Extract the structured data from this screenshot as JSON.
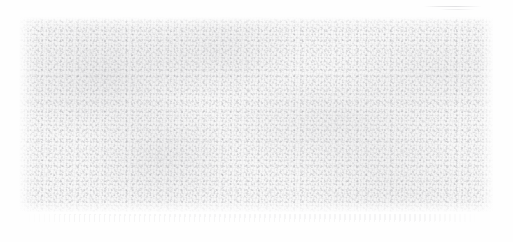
{
  "canvas": {
    "width": 513,
    "height": 242,
    "background_color": "#fefefe"
  },
  "surface": {
    "label": "",
    "kind": "textured-blank-surface",
    "description": "",
    "x": 19,
    "y": 17,
    "width": 474,
    "height": 195,
    "base_color": "#f7f7f7",
    "grain_color": "#8c8c92",
    "edge_color": "#fefefe",
    "visible_text": ""
  },
  "artifacts": {
    "top_streak_label": "",
    "residual_band_label": ""
  }
}
